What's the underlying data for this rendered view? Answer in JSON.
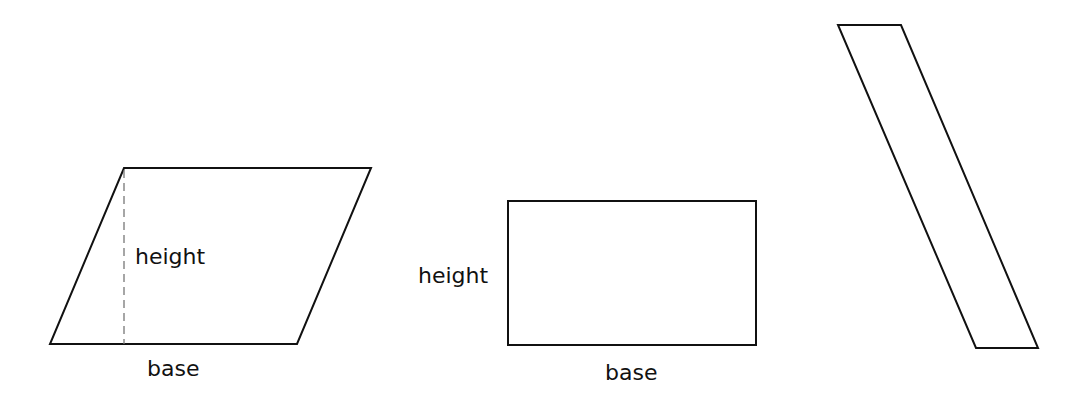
{
  "figure": {
    "shapes": [
      {
        "id": "parallelogram-1",
        "type": "parallelogram",
        "points": [
          [
            124,
            168
          ],
          [
            371,
            168
          ],
          [
            297,
            344
          ],
          [
            50,
            344
          ]
        ],
        "height_line": {
          "x": 124,
          "y1": 170,
          "y2": 344,
          "style": "dashed"
        },
        "labels": {
          "height": {
            "text": "height",
            "x": 135,
            "y": 264
          },
          "base": {
            "text": "base",
            "x": 147,
            "y": 376
          }
        }
      },
      {
        "id": "rectangle",
        "type": "rectangle",
        "points": [
          [
            508,
            201
          ],
          [
            756,
            201
          ],
          [
            756,
            345
          ],
          [
            508,
            345
          ]
        ],
        "labels": {
          "height": {
            "text": "height",
            "x": 418,
            "y": 283
          },
          "base": {
            "text": "base",
            "x": 605,
            "y": 380
          }
        }
      },
      {
        "id": "parallelogram-2",
        "type": "parallelogram",
        "points": [
          [
            838,
            25
          ],
          [
            901,
            25
          ],
          [
            1038,
            348
          ],
          [
            976,
            348
          ]
        ],
        "labels": {}
      }
    ],
    "colors": {
      "stroke": "#111111",
      "dashed": "#777777",
      "background": "#ffffff"
    }
  }
}
